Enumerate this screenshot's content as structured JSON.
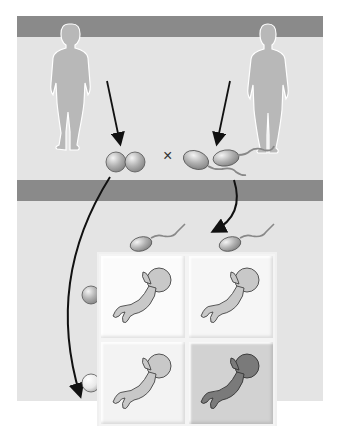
{
  "diagram": {
    "type": "punnett-square-inheritance",
    "top_row": {
      "female_parent": {
        "icon": "female-silhouette-icon"
      },
      "male_parent": {
        "icon": "male-silhouette-icon"
      },
      "cross_symbol": "×",
      "female_gametes": {
        "count": 2,
        "icon": "egg-icon"
      },
      "male_gametes": {
        "count": 2,
        "icon": "sperm-icon"
      }
    },
    "grid": {
      "column_headers": [
        {
          "icon": "sperm-icon",
          "shade": "gray"
        },
        {
          "icon": "sperm-icon",
          "shade": "gray"
        }
      ],
      "row_headers": [
        {
          "icon": "egg-icon",
          "shade": "gray"
        },
        {
          "icon": "egg-icon",
          "shade": "white"
        }
      ],
      "cells": [
        {
          "icon": "fetus-icon",
          "shade": "light",
          "color": "#c8c8c8"
        },
        {
          "icon": "fetus-icon",
          "shade": "light",
          "color": "#c8c8c8"
        },
        {
          "icon": "fetus-icon",
          "shade": "light",
          "color": "#c8c8c8"
        },
        {
          "icon": "fetus-icon",
          "shade": "dark",
          "color": "#7a7a7a"
        }
      ]
    },
    "colors": {
      "band": "#8a8a8a",
      "panel": "#e4e4e4",
      "silhouette": "#b8b8b8",
      "highlight_cell": "#cfcfcf"
    }
  }
}
